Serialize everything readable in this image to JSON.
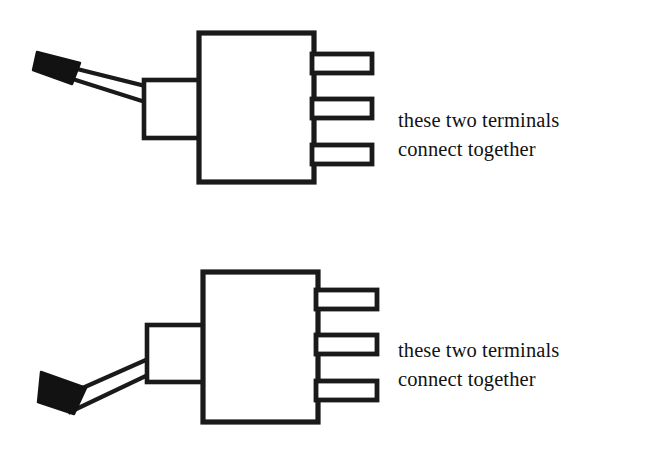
{
  "document": {
    "type": "technical-line-drawing",
    "subject": "toggle switch terminal wiring",
    "background_color": "#ffffff",
    "ink_color": "#1a1a1a",
    "width": 672,
    "height": 457
  },
  "figures": [
    {
      "id": "switch-top",
      "name": "toggle-switch-lever-up",
      "lever_position": "up",
      "lever_direction": "upper-left",
      "terminal_count": 3,
      "body": {
        "x": 199,
        "y": 33,
        "width": 115,
        "height": 149
      },
      "bushing": {
        "x": 144,
        "y": 80,
        "width": 55,
        "height": 58
      },
      "lever": {
        "tip_color": "#000000",
        "shaft_fill": "#ffffff",
        "tip_x": 38,
        "tip_y": 52
      },
      "terminals": [
        {
          "index": 1,
          "label": "terminal-1",
          "x": 313,
          "y": 54,
          "width": 59,
          "height": 18
        },
        {
          "index": 2,
          "label": "terminal-2",
          "x": 313,
          "y": 99,
          "width": 59,
          "height": 18
        },
        {
          "index": 3,
          "label": "terminal-3",
          "x": 313,
          "y": 145,
          "width": 59,
          "height": 18
        }
      ],
      "annotation": {
        "line1": "these two terminals",
        "line2": "connect together",
        "refers_to_terminals": [
          2,
          3
        ]
      }
    },
    {
      "id": "switch-bottom",
      "name": "toggle-switch-lever-down",
      "lever_position": "down",
      "lever_direction": "lower-left",
      "terminal_count": 3,
      "body": {
        "x": 203,
        "y": 272,
        "width": 115,
        "height": 150
      },
      "bushing": {
        "x": 147,
        "y": 325,
        "width": 56,
        "height": 57
      },
      "lever": {
        "tip_color": "#000000",
        "shaft_fill": "#ffffff",
        "tip_x": 40,
        "tip_y": 380
      },
      "terminals": [
        {
          "index": 1,
          "label": "terminal-1",
          "x": 317,
          "y": 290,
          "width": 60,
          "height": 19
        },
        {
          "index": 2,
          "label": "terminal-2",
          "x": 317,
          "y": 335,
          "width": 60,
          "height": 19
        },
        {
          "index": 3,
          "label": "terminal-3",
          "x": 317,
          "y": 381,
          "width": 60,
          "height": 19
        }
      ],
      "annotation": {
        "line1": "these two terminals",
        "line2": "connect together",
        "refers_to_terminals": [
          1,
          2
        ]
      }
    }
  ],
  "captions": {
    "top": {
      "line1": "these two terminals",
      "line2": "connect together"
    },
    "bottom": {
      "line1": "these two terminals",
      "line2": "connect together"
    }
  }
}
